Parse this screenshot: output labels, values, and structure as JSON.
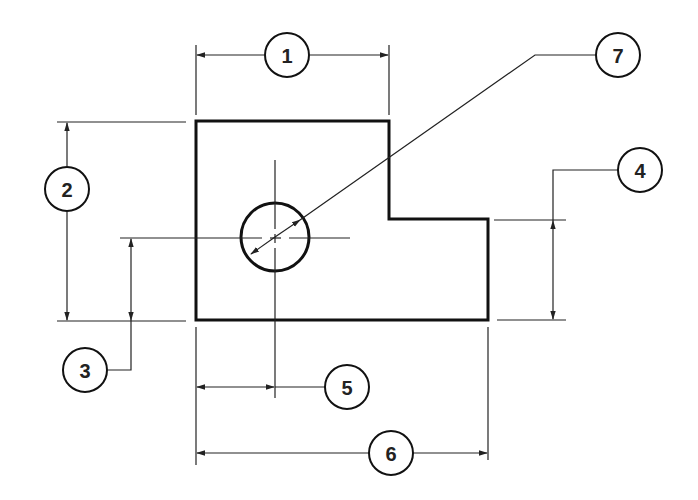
{
  "diagram": {
    "type": "engineering-dimension-drawing",
    "line_color": "#111111",
    "background": "#ffffff",
    "balloons": [
      {
        "id": 1,
        "label": "1",
        "refers_to": "overall width of upper portion"
      },
      {
        "id": 2,
        "label": "2",
        "refers_to": "overall height"
      },
      {
        "id": 3,
        "label": "3",
        "refers_to": "hole center height from bottom edge"
      },
      {
        "id": 4,
        "label": "4",
        "refers_to": "height of step (right portion)"
      },
      {
        "id": 5,
        "label": "5",
        "refers_to": "hole center distance from left edge"
      },
      {
        "id": 6,
        "label": "6",
        "refers_to": "overall length"
      },
      {
        "id": 7,
        "label": "7",
        "refers_to": "hole diameter"
      }
    ]
  }
}
